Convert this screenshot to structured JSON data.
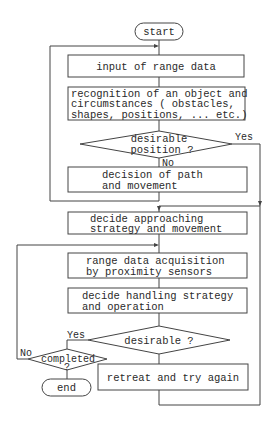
{
  "diagram": {
    "type": "flowchart",
    "nodes": {
      "start": {
        "label": "start"
      },
      "input": {
        "label": "input of range data"
      },
      "recognition": {
        "lines": [
          "recognition of an object and",
          "circumstances ( obstacles,",
          "shapes, positions,  ... etc.)"
        ]
      },
      "desirable_position": {
        "lines": [
          "desirable",
          "position ?"
        ]
      },
      "decision_path": {
        "lines": [
          "decision of path",
          "and movement"
        ]
      },
      "approach": {
        "lines": [
          "decide approaching",
          "strategy and movement"
        ]
      },
      "acquisition": {
        "lines": [
          "range data acquisition",
          "by proximity sensors"
        ]
      },
      "handling": {
        "lines": [
          "decide handling strategy",
          "and operation"
        ]
      },
      "desirable": {
        "label": "desirable ?"
      },
      "completed": {
        "lines": [
          "completed",
          "?"
        ]
      },
      "end": {
        "label": "end"
      },
      "retreat": {
        "label": "retreat and try again"
      }
    },
    "edge_labels": {
      "pos_yes": "Yes",
      "pos_no": "No",
      "des_yes": "Yes",
      "comp_no": "No"
    }
  }
}
